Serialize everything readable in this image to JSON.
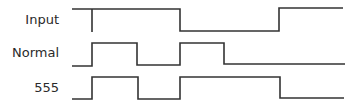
{
  "diagram": {
    "type": "timing-diagram",
    "signals": [
      {
        "label": "Input",
        "points": "72,9 92,9 92,32 92,9 180,9 180,31 279,31 279,8 343,8"
      },
      {
        "label": "Normal",
        "points": "72,66 92,66 92,43 137,43 137,65 180,65 180,43 224,43 224,64 345,64"
      },
      {
        "label": "555",
        "points": "72,99 92,99 92,77 138,77 138,99 180,99 180,77 280,77 280,98 344,98"
      }
    ],
    "colors": {
      "line": "#333333",
      "text": "#2a2a2a",
      "background": "#ffffff"
    }
  }
}
